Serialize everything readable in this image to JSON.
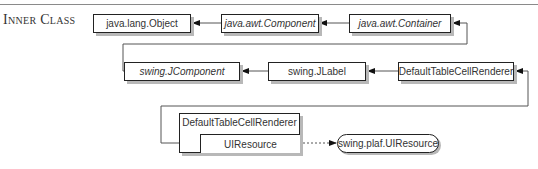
{
  "section": {
    "title": "Inner Class"
  },
  "diagram": {
    "nodes": [
      {
        "id": "object",
        "label": "java.lang.Object",
        "italic": false
      },
      {
        "id": "component",
        "label": "java.awt.Component",
        "italic": true
      },
      {
        "id": "container",
        "label": "java.awt.Container",
        "italic": true
      },
      {
        "id": "jcomponent",
        "label": "swing.JComponent",
        "italic": true
      },
      {
        "id": "jlabel",
        "label": "swing.JLabel",
        "italic": false
      },
      {
        "id": "dtcr",
        "label": "DefaultTableCellRenderer",
        "italic": false
      },
      {
        "id": "dtcr_uiresource_outer",
        "label": "DefaultTableCellRenderer",
        "italic": false
      },
      {
        "id": "dtcr_uiresource_inner",
        "label": "UIResource",
        "italic": false
      },
      {
        "id": "uiresource_iface",
        "label": "swing.plaf.UIResource",
        "shape": "pill"
      }
    ],
    "edges": [
      {
        "from": "component",
        "to": "object",
        "style": "solid"
      },
      {
        "from": "container",
        "to": "component",
        "style": "solid"
      },
      {
        "from": "jcomponent",
        "to": "container",
        "style": "solid"
      },
      {
        "from": "jlabel",
        "to": "jcomponent",
        "style": "solid"
      },
      {
        "from": "dtcr",
        "to": "jlabel",
        "style": "solid"
      },
      {
        "from": "dtcr_uiresource_inner",
        "to": "dtcr",
        "style": "solid"
      },
      {
        "from": "dtcr_uiresource_inner",
        "to": "uiresource_iface",
        "style": "dashed"
      }
    ]
  }
}
